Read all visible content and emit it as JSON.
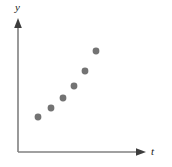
{
  "chart_data": {
    "type": "scatter",
    "title": "",
    "subtitle": "",
    "xlabel": "t",
    "ylabel": "y",
    "grid": false,
    "legend": null,
    "axis_style": {
      "x_arrow": true,
      "y_arrow": true,
      "ticks": false,
      "tick_labels": false,
      "axis_color": "#808080",
      "origin_px": [
        18,
        152
      ],
      "x_axis_end_px": [
        146,
        152
      ],
      "y_axis_end_px": [
        18,
        19
      ]
    },
    "xlim": [
      0,
      10
    ],
    "ylim": [
      0,
      10
    ],
    "marker": {
      "shape": "circle",
      "color": "#737373",
      "radius_px": 3.4
    },
    "series": [
      {
        "name": "observations",
        "color": "#737373",
        "points_px": [
          [
            38,
            117
          ],
          [
            51,
            108
          ],
          [
            63,
            98
          ],
          [
            74,
            86
          ],
          [
            85,
            71
          ],
          [
            96,
            51
          ]
        ],
        "x": [
          1.6,
          2.6,
          3.5,
          4.4,
          5.2,
          6.1
        ],
        "y": [
          2.6,
          3.3,
          4.1,
          5.0,
          6.1,
          7.6
        ]
      }
    ],
    "annotations": []
  },
  "labels": {
    "y_axis": "y",
    "x_axis": "t"
  },
  "colors": {
    "axis": "#808080",
    "marker": "#737373",
    "label": "#1a1a1a",
    "background": "#ffffff"
  }
}
